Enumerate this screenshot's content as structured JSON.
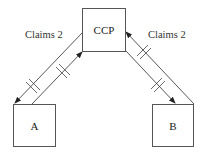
{
  "diagram": {
    "nodes": [
      {
        "id": "ccp",
        "label": "CCP"
      },
      {
        "id": "a",
        "label": "A"
      },
      {
        "id": "b",
        "label": "B"
      }
    ],
    "edge_labels": {
      "left": "Claims 2",
      "right": "Claims 2"
    },
    "edges": [
      {
        "from": "CCP",
        "to": "A",
        "hash_marks": 2
      },
      {
        "from": "A",
        "to": "CCP",
        "hash_marks": 2
      },
      {
        "from": "B",
        "to": "CCP",
        "hash_marks": 2
      },
      {
        "from": "CCP",
        "to": "B",
        "hash_marks": 2
      }
    ],
    "colors": {
      "stroke": "#444444",
      "text": "#222222"
    }
  }
}
